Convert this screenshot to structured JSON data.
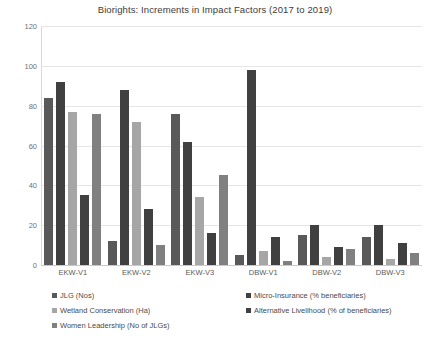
{
  "chart_data": {
    "type": "bar",
    "title": "Biorights: Increments in Impact Factors (2017 to 2019)",
    "xlabel": "",
    "ylabel": "",
    "ylim": [
      0,
      120
    ],
    "yticks": [
      0,
      20,
      40,
      60,
      80,
      100,
      120
    ],
    "grid": true,
    "legend_position": "bottom",
    "categories": [
      "EKW-V1",
      "EKW-V2",
      "EKW-V3",
      "DBW-V1",
      "DBW-V2",
      "DBW-V3"
    ],
    "series": [
      {
        "name": "JLG (Nos)",
        "color": "#595959",
        "values": [
          84,
          12,
          76,
          5,
          15,
          14
        ]
      },
      {
        "name": "Micro-Insurance (% beneficiaries)",
        "color": "#404040",
        "values": [
          92,
          88,
          62,
          98,
          20,
          20
        ]
      },
      {
        "name": "Wetland Conservation (Ha)",
        "color": "#a6a6a6",
        "values": [
          77,
          72,
          34,
          7,
          4,
          3
        ]
      },
      {
        "name": "Alternative Livelihood (% of beneficiaries)",
        "color": "#404040",
        "values": [
          35,
          28,
          16,
          14,
          9,
          11
        ]
      },
      {
        "name": "Women Leadership (No of JLGs)",
        "color": "#808080",
        "values": [
          76,
          10,
          45,
          2,
          8,
          6
        ]
      }
    ]
  },
  "legend": {
    "column_left": [
      "JLG (Nos)",
      "Wetland Conservation (Ha)",
      "Women Leadership (No of JLGs)"
    ],
    "column_right": [
      "Micro-Insurance (% beneficiaries)",
      "Alternative Livelihood (% of beneficiaries)"
    ]
  }
}
